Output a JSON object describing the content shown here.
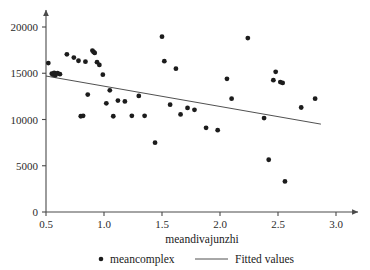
{
  "chart_data": {
    "type": "scatter",
    "title": "",
    "xlabel": "meandivajunzhi",
    "ylabel": "",
    "xlim": [
      0.4,
      3.05
    ],
    "ylim": [
      0,
      21500
    ],
    "grid": false,
    "xticks": [
      0.5,
      1.0,
      1.5,
      2.0,
      2.5,
      3.0
    ],
    "xtick_labels": [
      "0.5",
      "1.0",
      "1.5",
      "2.0",
      "2.5",
      "3.0"
    ],
    "yticks": [
      0,
      5000,
      10000,
      15000,
      20000
    ],
    "ytick_labels": [
      "0",
      "5000",
      "10000",
      "15000",
      "20000"
    ],
    "legend_position": "below-axis-center",
    "series": [
      {
        "name": "meancomplex",
        "type": "scatter",
        "marker": "circle",
        "color": "#1c1c1c",
        "points": [
          [
            0.52,
            16100
          ],
          [
            0.55,
            14950
          ],
          [
            0.56,
            14850
          ],
          [
            0.57,
            15050
          ],
          [
            0.58,
            14750
          ],
          [
            0.6,
            15000
          ],
          [
            0.62,
            14900
          ],
          [
            0.68,
            17050
          ],
          [
            0.74,
            16700
          ],
          [
            0.78,
            16350
          ],
          [
            0.8,
            10350
          ],
          [
            0.82,
            10400
          ],
          [
            0.84,
            16250
          ],
          [
            0.86,
            12700
          ],
          [
            0.9,
            17450
          ],
          [
            0.91,
            17300
          ],
          [
            0.92,
            17200
          ],
          [
            0.94,
            16200
          ],
          [
            0.96,
            15900
          ],
          [
            0.99,
            14850
          ],
          [
            1.02,
            11750
          ],
          [
            1.05,
            13150
          ],
          [
            1.08,
            10350
          ],
          [
            1.12,
            12050
          ],
          [
            1.18,
            11950
          ],
          [
            1.24,
            10400
          ],
          [
            1.3,
            12550
          ],
          [
            1.35,
            10400
          ],
          [
            1.44,
            7500
          ],
          [
            1.5,
            18950
          ],
          [
            1.52,
            16300
          ],
          [
            1.57,
            11600
          ],
          [
            1.62,
            15500
          ],
          [
            1.66,
            10550
          ],
          [
            1.72,
            11250
          ],
          [
            1.78,
            11050
          ],
          [
            1.88,
            9100
          ],
          [
            1.98,
            8850
          ],
          [
            2.06,
            14400
          ],
          [
            2.1,
            12250
          ],
          [
            2.24,
            18800
          ],
          [
            2.38,
            10150
          ],
          [
            2.42,
            5650
          ],
          [
            2.46,
            14250
          ],
          [
            2.48,
            15150
          ],
          [
            2.52,
            14050
          ],
          [
            2.54,
            13950
          ],
          [
            2.56,
            3300
          ],
          [
            2.7,
            11300
          ],
          [
            2.82,
            12250
          ]
        ]
      },
      {
        "name": "Fitted values",
        "type": "line",
        "color": "#3c3c3c",
        "x": [
          0.5,
          2.87
        ],
        "y": [
          14700,
          9500
        ]
      }
    ]
  },
  "legend": {
    "entries": [
      {
        "label": "meancomplex",
        "marker": "dot",
        "color": "#1c1c1c"
      },
      {
        "label": "Fitted values",
        "marker": "line",
        "color": "#3c3c3c"
      }
    ]
  },
  "axes": {
    "x_axis_name": "x-axis",
    "y_axis_name": "y-axis"
  }
}
